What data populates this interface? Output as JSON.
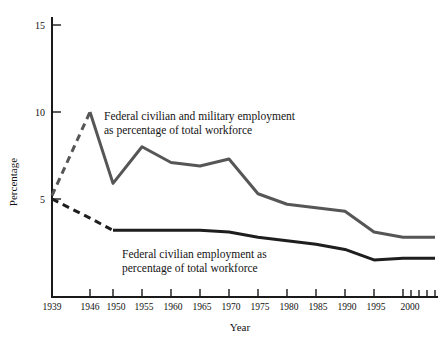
{
  "chart_data": {
    "type": "line",
    "title": "",
    "xlabel": "Year",
    "ylabel": "Percentage",
    "xlim": [
      1939,
      2004
    ],
    "ylim": [
      0,
      15
    ],
    "yticks": [
      5,
      10,
      15
    ],
    "ytick_labels": [
      "5",
      "10",
      "15"
    ],
    "xticks": [
      1939,
      1946,
      1950,
      1955,
      1960,
      1965,
      1970,
      1975,
      1980,
      1985,
      1990,
      1995,
      2000
    ],
    "xtick_labels": [
      "1939",
      "1946",
      "1950",
      "1955",
      "1960",
      "1965",
      "1970",
      "1975",
      "1980",
      "1985",
      "1990",
      "1995",
      "2000"
    ],
    "minor_xticks": [
      2001,
      2002,
      2003,
      2004
    ],
    "grid": false,
    "legend": "inline-annotations",
    "series": [
      {
        "name": "Federal civilian and military employment as percentage of total workforce",
        "color": "#565656",
        "width": 3.0,
        "dashed_segment_years": [
          1939,
          1946
        ],
        "x": [
          1939,
          1946,
          1950,
          1955,
          1960,
          1965,
          1970,
          1975,
          1980,
          1985,
          1990,
          1995,
          2000,
          2004
        ],
        "y": [
          5.2,
          10.0,
          5.9,
          8.0,
          7.1,
          6.9,
          7.3,
          5.3,
          4.7,
          4.5,
          4.3,
          3.1,
          2.8,
          2.8
        ]
      },
      {
        "name": "Federal civilian employment as percentage of total workforce",
        "color": "#1e1e1e",
        "width": 3.0,
        "dashed_segment_years": [
          1939,
          1950
        ],
        "x": [
          1939,
          1946,
          1950,
          1955,
          1960,
          1965,
          1970,
          1975,
          1980,
          1985,
          1990,
          1995,
          2000,
          2004
        ],
        "y": [
          5.0,
          3.9,
          3.2,
          3.2,
          3.2,
          3.2,
          3.1,
          2.8,
          2.6,
          2.4,
          2.1,
          1.5,
          1.6,
          1.6
        ]
      }
    ],
    "annotations": [
      {
        "id": "upper-series-label",
        "lines": [
          "Federal civilian and military employment",
          "as percentage of total workforce"
        ],
        "x": 104,
        "y": 120
      },
      {
        "id": "lower-series-label",
        "lines": [
          "Federal civilian employment as",
          "percentage of total workforce"
        ],
        "x": 122,
        "y": 258
      }
    ]
  },
  "colors": {
    "background": "#ffffff",
    "axis": "#1a1a1a",
    "text": "#111111",
    "series_upper": "#565656",
    "series_lower": "#1e1e1e"
  }
}
